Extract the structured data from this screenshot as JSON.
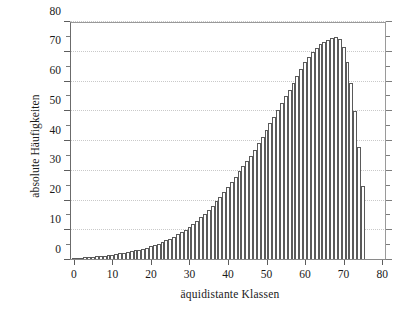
{
  "chart_data": {
    "type": "bar",
    "title": "",
    "subtitle": "",
    "xlabel": "äquidistante Klassen",
    "ylabel": "absolute Häufigkeiten",
    "xlim": [
      -1,
      81
    ],
    "ylim": [
      0,
      80
    ],
    "grid": true,
    "legend": null,
    "x_major_ticks": [
      0,
      10,
      20,
      30,
      40,
      50,
      60,
      70,
      80
    ],
    "x_tick_labels": [
      "0",
      "10",
      "20",
      "30",
      "40",
      "50",
      "60",
      "70",
      "80"
    ],
    "y_major_ticks": [
      0,
      10,
      20,
      30,
      40,
      50,
      60,
      70,
      80
    ],
    "y_tick_labels": [
      "0",
      "10",
      "20",
      "30",
      "40",
      "50",
      "60",
      "70",
      "80"
    ],
    "y_minor_ticks": [
      5,
      15,
      25,
      35,
      45,
      55,
      65,
      75
    ],
    "bar_edge_color": "#5a5a5a",
    "bar_fill_color": "#ffffff",
    "grid_color": "#c9c9c9",
    "axis_color": "#5d5d5d",
    "categories": [
      0,
      1,
      2,
      3,
      4,
      5,
      6,
      7,
      8,
      9,
      10,
      11,
      12,
      13,
      14,
      15,
      16,
      17,
      18,
      19,
      20,
      21,
      22,
      23,
      24,
      25,
      26,
      27,
      28,
      29,
      30,
      31,
      32,
      33,
      34,
      35,
      36,
      37,
      38,
      39,
      40,
      41,
      42,
      43,
      44,
      45,
      46,
      47,
      48,
      49,
      50,
      51,
      52,
      53,
      54,
      55,
      56,
      57,
      58,
      59,
      60,
      61,
      62,
      63,
      64,
      65,
      66,
      67,
      68,
      69,
      70,
      71,
      72,
      73,
      74,
      75
    ],
    "values": [
      0.6,
      0.7,
      0.8,
      0.9,
      1.0,
      1.1,
      1.2,
      1.3,
      1.5,
      1.6,
      1.8,
      2.0,
      2.2,
      2.4,
      2.6,
      2.9,
      3.2,
      3.5,
      3.8,
      4.2,
      4.6,
      5.0,
      5.5,
      6.0,
      6.6,
      7.2,
      7.9,
      8.6,
      9.4,
      10.2,
      11.1,
      12.1,
      13.2,
      14.3,
      15.5,
      16.8,
      18.2,
      19.7,
      21.2,
      22.8,
      24.5,
      26.2,
      28.0,
      29.8,
      31.5,
      33.2,
      35.0,
      37.0,
      39.2,
      41.5,
      43.8,
      46.0,
      48.2,
      50.5,
      52.8,
      55.0,
      57.2,
      59.5,
      62.0,
      64.3,
      66.5,
      68.3,
      70.0,
      71.3,
      72.5,
      73.4,
      74.0,
      74.5,
      74.8,
      74.3,
      71.5,
      66.5,
      59.5,
      50.0,
      38.0,
      25.0
    ]
  }
}
